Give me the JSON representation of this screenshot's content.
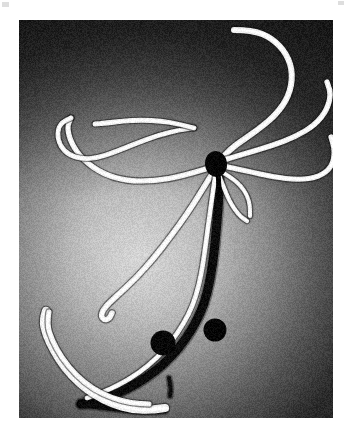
{
  "figure": {
    "kind": "electron-micrograph",
    "caption": "",
    "alt_text": "Electron micrograph of filamentous strands radiating from a dark central junction",
    "frame": {
      "x": 19,
      "y": 20,
      "width": 314,
      "height": 398
    },
    "background": {
      "edge_color": "#3a3a3a",
      "dark_corner_color": "#2e2e2e",
      "glow_color": "#d6d6d6",
      "glow_center_x": 0.38,
      "glow_center_y": 0.6,
      "glow_radius": 0.58,
      "grain_opacity": 0.16
    },
    "palette": {
      "filament_light": "#f4f4f4",
      "filament_light_core": "#ffffff",
      "filament_dark": "#0c0c0c",
      "node_dark": "#050505",
      "granule_dark": "#070707",
      "paper_white": "#ffffff",
      "artifact_gray": "#d8d8d8"
    },
    "artifacts": [
      {
        "name": "corner-artifact-left",
        "x": 2,
        "y": 2,
        "width": 7,
        "height": 5
      },
      {
        "name": "corner-artifact-right",
        "x": 338,
        "y": 1,
        "width": 6,
        "height": 4
      }
    ],
    "junction_node": {
      "name": "central-junction-node",
      "cx": 197,
      "cy": 144,
      "rx": 11,
      "ry": 13,
      "rotation": -8,
      "color": "#050505"
    },
    "granules": [
      {
        "name": "free-granule",
        "cx": 144,
        "cy": 323,
        "r": 12.5,
        "color": "#080808"
      },
      {
        "name": "attached-granule",
        "cx": 196,
        "cy": 310,
        "r": 11.5,
        "color": "#060606"
      }
    ],
    "light_filaments": [
      {
        "name": "filament-upper-right-long-arc",
        "width": 6.0,
        "points": [
          [
            215,
            10
          ],
          [
            233,
            10
          ],
          [
            253,
            18
          ],
          [
            268,
            34
          ],
          [
            274,
            54
          ],
          [
            270,
            76
          ],
          [
            257,
            95
          ],
          [
            236,
            112
          ],
          [
            215,
            126
          ],
          [
            203,
            138
          ]
        ]
      },
      {
        "name": "filament-right-upper-branch",
        "width": 5.4,
        "points": [
          [
            205,
            140
          ],
          [
            228,
            133
          ],
          [
            252,
            126
          ],
          [
            276,
            117
          ],
          [
            296,
            105
          ],
          [
            308,
            90
          ],
          [
            312,
            74
          ],
          [
            308,
            62
          ]
        ]
      },
      {
        "name": "filament-right-lower-branch",
        "width": 5.2,
        "points": [
          [
            204,
            146
          ],
          [
            228,
            151
          ],
          [
            254,
            157
          ],
          [
            280,
            160
          ],
          [
            300,
            157
          ],
          [
            313,
            147
          ],
          [
            316,
            131
          ],
          [
            312,
            117
          ]
        ]
      },
      {
        "name": "filament-left-long-sweep",
        "width": 5.2,
        "points": [
          [
            190,
            148
          ],
          [
            164,
            156
          ],
          [
            136,
            161
          ],
          [
            108,
            161
          ],
          [
            84,
            154
          ],
          [
            64,
            140
          ],
          [
            52,
            123
          ],
          [
            48,
            107
          ],
          [
            52,
            98
          ]
        ]
      },
      {
        "name": "filament-left-hook-loop",
        "width": 4.6,
        "points": [
          [
            52,
            98
          ],
          [
            42,
            102
          ],
          [
            38,
            113
          ],
          [
            41,
            126
          ],
          [
            50,
            135
          ],
          [
            63,
            139
          ],
          [
            78,
            138
          ],
          [
            96,
            132
          ],
          [
            118,
            123
          ],
          [
            140,
            115
          ],
          [
            160,
            110
          ],
          [
            175,
            108
          ]
        ]
      },
      {
        "name": "filament-left-upper-tail",
        "width": 4.8,
        "points": [
          [
            175,
            108
          ],
          [
            160,
            104
          ],
          [
            142,
            101
          ],
          [
            122,
            100
          ],
          [
            104,
            101
          ],
          [
            88,
            103
          ],
          [
            76,
            104
          ]
        ]
      },
      {
        "name": "filament-descending-left-curl",
        "width": 5.4,
        "points": [
          [
            193,
            154
          ],
          [
            182,
            172
          ],
          [
            168,
            194
          ],
          [
            152,
            216
          ],
          [
            135,
            238
          ],
          [
            117,
            258
          ],
          [
            101,
            273
          ],
          [
            90,
            283
          ],
          [
            84,
            290
          ],
          [
            82,
            296
          ],
          [
            85,
            300
          ],
          [
            90,
            299
          ],
          [
            93,
            293
          ]
        ]
      },
      {
        "name": "filament-node-short-spur-a",
        "width": 4.2,
        "points": [
          [
            200,
            155
          ],
          [
            205,
            168
          ],
          [
            210,
            180
          ],
          [
            216,
            190
          ],
          [
            222,
            197
          ],
          [
            228,
            201
          ]
        ]
      },
      {
        "name": "filament-node-short-spur-b",
        "width": 4.0,
        "points": [
          [
            203,
            152
          ],
          [
            213,
            158
          ],
          [
            222,
            166
          ],
          [
            228,
            175
          ],
          [
            231,
            185
          ],
          [
            231,
            196
          ]
        ]
      },
      {
        "name": "filament-dark-strand-highlight",
        "width": 4.6,
        "points": [
          [
            196,
            158
          ],
          [
            193,
            178
          ],
          [
            190,
            200
          ],
          [
            187,
            222
          ],
          [
            184,
            244
          ],
          [
            180,
            265
          ],
          [
            174,
            285
          ],
          [
            165,
            303
          ],
          [
            153,
            321
          ],
          [
            138,
            338
          ],
          [
            120,
            353
          ],
          [
            100,
            365
          ],
          [
            82,
            373
          ],
          [
            68,
            378
          ]
        ]
      },
      {
        "name": "filament-lower-left-thick",
        "width": 8.2,
        "points": [
          [
            27,
            291
          ],
          [
            24,
            300
          ],
          [
            27,
            314
          ],
          [
            35,
            331
          ],
          [
            46,
            348
          ],
          [
            60,
            363
          ],
          [
            76,
            375
          ],
          [
            94,
            384
          ],
          [
            112,
            389
          ],
          [
            130,
            390
          ],
          [
            146,
            388
          ]
        ]
      },
      {
        "name": "filament-lower-left-thick-inner",
        "width": 5.0,
        "points": [
          [
            30,
            292
          ],
          [
            28,
            304
          ],
          [
            33,
            320
          ],
          [
            43,
            338
          ],
          [
            57,
            355
          ],
          [
            74,
            369
          ],
          [
            93,
            378
          ],
          [
            112,
            383
          ],
          [
            130,
            384
          ]
        ]
      }
    ],
    "dark_filaments": [
      {
        "name": "dark-strand-main",
        "width": 9.0,
        "points": [
          [
            200,
            152
          ],
          [
            200,
            170
          ],
          [
            199,
            190
          ],
          [
            197,
            212
          ],
          [
            195,
            234
          ],
          [
            192,
            254
          ],
          [
            188,
            274
          ],
          [
            182,
            292
          ],
          [
            172,
            311
          ],
          [
            160,
            328
          ],
          [
            145,
            344
          ],
          [
            127,
            358
          ],
          [
            108,
            369
          ],
          [
            90,
            377
          ],
          [
            74,
            382
          ],
          [
            62,
            384
          ]
        ]
      },
      {
        "name": "dark-strand-lower-tail",
        "width": 6.5,
        "points": [
          [
            62,
            384
          ],
          [
            78,
            386
          ],
          [
            96,
            388
          ],
          [
            114,
            390
          ],
          [
            132,
            391
          ],
          [
            146,
            390
          ]
        ]
      },
      {
        "name": "dark-strand-short-stub",
        "width": 4.0,
        "points": [
          [
            150,
            358
          ],
          [
            152,
            368
          ],
          [
            151,
            376
          ]
        ]
      }
    ]
  }
}
